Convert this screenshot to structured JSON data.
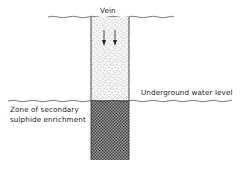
{
  "diagram": {
    "type": "geological cross-section",
    "labels": {
      "vein": "Vein",
      "water_level": "Underground water level",
      "zone_line1": "Zone of secondary",
      "zone_line2": "sulphide enrichment"
    },
    "arrows": {
      "count": 2,
      "direction": "down",
      "meaning": "downward percolation"
    },
    "colors": {
      "line": "#333333",
      "oxidized_zone_fill": "#e6e6e6",
      "enrichment_zone_fill": "#555555",
      "background": "#ffffff"
    }
  }
}
